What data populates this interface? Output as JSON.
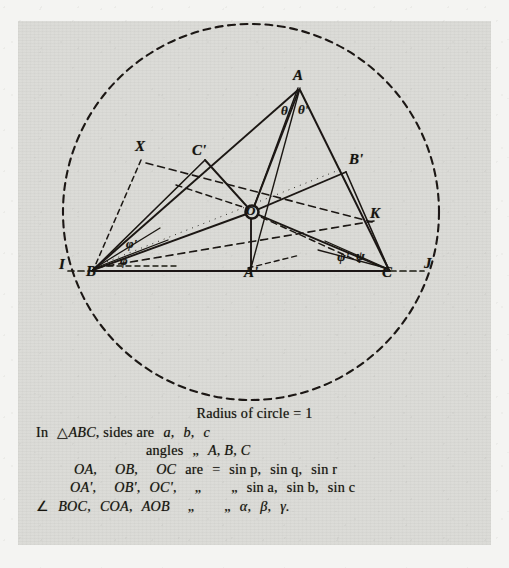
{
  "figure": {
    "title_semantic": "geometry-diagram-triangle-in-circle",
    "circle": {
      "label": "circumscribed-dashed-circle",
      "radius_note": "1"
    },
    "points": [
      {
        "id": "A",
        "label": "A",
        "x": 299,
        "y": 79
      },
      {
        "id": "B",
        "label": "B",
        "x": 92,
        "y": 274
      },
      {
        "id": "C",
        "label": "C",
        "x": 388,
        "y": 275
      },
      {
        "id": "Ap",
        "label": "A'",
        "x": 251,
        "y": 274
      },
      {
        "id": "Bp",
        "label": "B'",
        "x": 355,
        "y": 161
      },
      {
        "id": "Cp",
        "label": "C'",
        "x": 198,
        "y": 152
      },
      {
        "id": "O",
        "label": "O",
        "x": 253,
        "y": 213
      },
      {
        "id": "X",
        "label": "X",
        "x": 141,
        "y": 148
      },
      {
        "id": "K",
        "label": "K",
        "x": 376,
        "y": 215
      },
      {
        "id": "I",
        "label": "I",
        "x": 63,
        "y": 266
      },
      {
        "id": "J",
        "label": "J",
        "x": 428,
        "y": 265
      }
    ],
    "angle_labels": [
      {
        "id": "theta_left",
        "label": "θ",
        "x": 285,
        "y": 111
      },
      {
        "id": "theta_right",
        "label": "θ'",
        "x": 303,
        "y": 110
      },
      {
        "id": "phi_prime",
        "label": "φ'",
        "x": 130,
        "y": 245
      },
      {
        "id": "phi",
        "label": "φ",
        "x": 124,
        "y": 262
      },
      {
        "id": "psi_prime",
        "label": "ψ'",
        "x": 341,
        "y": 259
      },
      {
        "id": "psi",
        "label": "ψ",
        "x": 360,
        "y": 257
      }
    ]
  },
  "caption": {
    "line1": "Radius of circle = 1",
    "line2_pre": "In",
    "line2_tri": "△",
    "line2_abc": "ABC",
    "line2_mid": ", sides are",
    "line2_vals": "a,",
    "line2_vals2": "b,",
    "line2_vals3": "c",
    "line3_word": "angles",
    "line3_ditto": "„",
    "line3_vals": "A, B, C",
    "line4_a": "OA,",
    "line4_b": "OB,",
    "line4_c": "OC",
    "line4_are": "are",
    "line4_eq": "=",
    "line4_v1": "sin p,",
    "line4_v2": "sin q,",
    "line4_v3": "sin r",
    "line5_a": "OA',",
    "line5_b": "OB',",
    "line5_c": "OC',",
    "line5_d1": "„",
    "line5_d2": "„",
    "line5_v1": "sin a,",
    "line5_v2": "sin b,",
    "line5_v3": "sin c",
    "line6_sym": "∠",
    "line6_a": "BOC,",
    "line6_b": "COA,",
    "line6_c": "AOB",
    "line6_d1": "„",
    "line6_d2": "„",
    "line6_v1": "α,",
    "line6_v2": "β,",
    "line6_v3": "γ."
  },
  "colors": {
    "ink": "#15130f",
    "paper": "#dcdcd8",
    "page": "#f4f4f2"
  }
}
